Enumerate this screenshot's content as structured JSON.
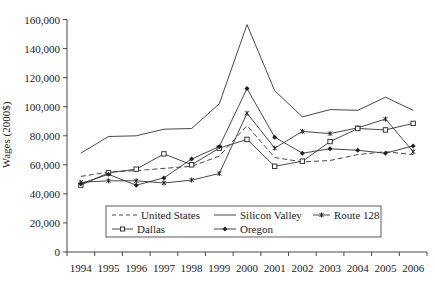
{
  "chart_data": {
    "type": "line",
    "title": "",
    "xlabel": "",
    "ylabel": "Wages (2000$)",
    "ylim": [
      0,
      160000
    ],
    "yticks": [
      0,
      20000,
      40000,
      60000,
      80000,
      100000,
      120000,
      140000,
      160000
    ],
    "ytick_labels": [
      "0",
      "20,000",
      "40,000",
      "60,000",
      "80,000",
      "100,000",
      "120,000",
      "140,000",
      "160,000"
    ],
    "grid": false,
    "legend_position": "inside-bottom-center",
    "categories": [
      "1994",
      "1995",
      "1996",
      "1997",
      "1998",
      "1999",
      "2000",
      "2001",
      "2002",
      "2003",
      "2004",
      "2005",
      "2006"
    ],
    "series": [
      {
        "name": "United States",
        "style": "dashed",
        "marker": "none",
        "values": [
          52000,
          55000,
          56000,
          57500,
          59000,
          66000,
          87000,
          65000,
          62000,
          63000,
          67000,
          69000,
          67000
        ]
      },
      {
        "name": "Silicon Valley",
        "style": "solid",
        "marker": "none",
        "values": [
          68000,
          79500,
          80000,
          84500,
          85000,
          102000,
          156500,
          111000,
          93000,
          98000,
          97500,
          106500,
          97500
        ]
      },
      {
        "name": "Route 128",
        "style": "solid",
        "marker": "star",
        "values": [
          48000,
          49000,
          49000,
          47500,
          49500,
          54000,
          95500,
          71500,
          83000,
          81500,
          85500,
          91500,
          69000
        ]
      },
      {
        "name": "Dallas",
        "style": "solid",
        "marker": "square",
        "values": [
          46000,
          54500,
          57000,
          67500,
          60000,
          71500,
          77500,
          59000,
          62500,
          76000,
          85000,
          84000,
          88500
        ]
      },
      {
        "name": "Oregon",
        "style": "solid",
        "marker": "diamond",
        "values": [
          47000,
          53500,
          46000,
          51000,
          64000,
          72500,
          112500,
          79000,
          68000,
          71000,
          70000,
          68000,
          73000
        ]
      }
    ]
  },
  "legend": {
    "row1": [
      "United States",
      "Silicon Valley",
      "Route 128"
    ],
    "row2": [
      "Dallas",
      "Oregon"
    ]
  }
}
